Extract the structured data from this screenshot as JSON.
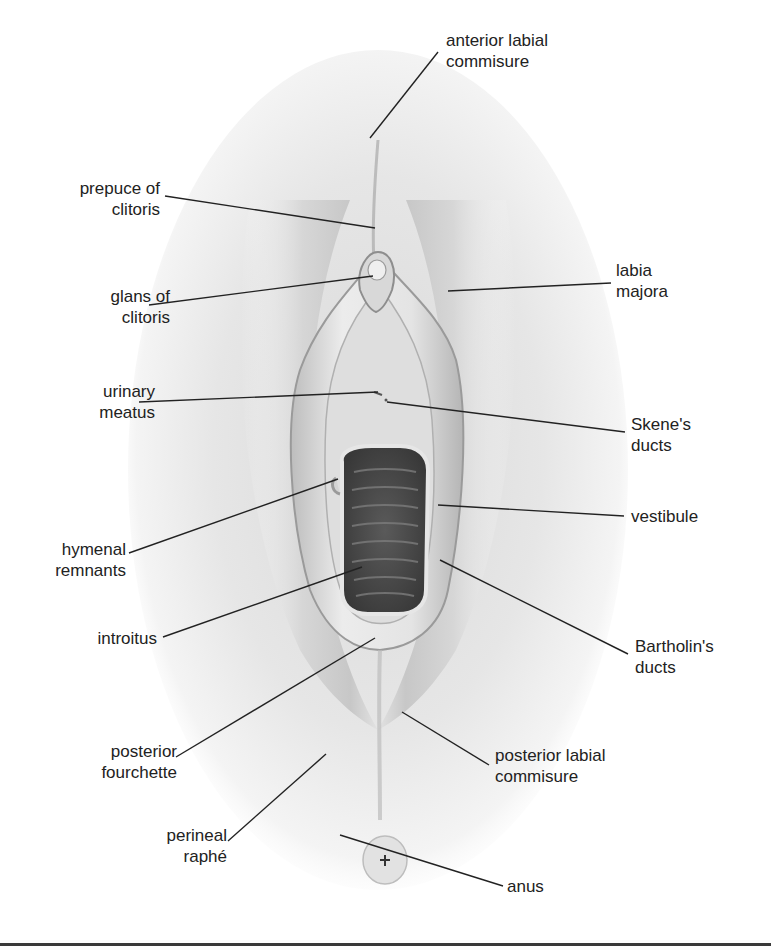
{
  "figure": {
    "colors": {
      "line": "#222222",
      "text": "#222222",
      "skin_light": "#f4f4f4",
      "skin_mid": "#cfcfcf",
      "skin_dark": "#8e8e8e",
      "introitus": "#4e4e4e"
    },
    "labels": [
      {
        "id": "anterior-labial-commisure",
        "lines": [
          "anterior labial",
          "commisure"
        ],
        "side": "right",
        "x": 446,
        "y": 30,
        "lx1": 438,
        "ly1": 52,
        "lx2": 370,
        "ly2": 138
      },
      {
        "id": "prepuce-of-clitoris",
        "lines": [
          "prepuce of",
          "clitoris"
        ],
        "side": "left",
        "x": 58,
        "y": 178,
        "w": 102,
        "lx1": 165,
        "ly1": 196,
        "lx2": 375,
        "ly2": 228
      },
      {
        "id": "glans-of-clitoris",
        "lines": [
          "glans of",
          "clitoris"
        ],
        "side": "left",
        "x": 60,
        "y": 286,
        "w": 110,
        "lx1": 149,
        "ly1": 305,
        "lx2": 373,
        "ly2": 276
      },
      {
        "id": "labia-majora",
        "lines": [
          "labia",
          "majora"
        ],
        "side": "right",
        "x": 616,
        "y": 260,
        "lx1": 611,
        "ly1": 283,
        "lx2": 448,
        "ly2": 291
      },
      {
        "id": "urinary-meatus",
        "lines": [
          "urinary",
          "meatus"
        ],
        "side": "left",
        "x": 60,
        "y": 381,
        "w": 95,
        "lx1": 139,
        "ly1": 402,
        "lx2": 378,
        "ly2": 392
      },
      {
        "id": "skenes-ducts",
        "lines": [
          "Skene's",
          "ducts"
        ],
        "side": "right",
        "x": 631,
        "y": 414,
        "lx1": 625,
        "ly1": 432,
        "lx2": 387,
        "ly2": 402
      },
      {
        "id": "vestibule",
        "lines": [
          "vestibule"
        ],
        "side": "right",
        "x": 631,
        "y": 506,
        "lx1": 624,
        "ly1": 516,
        "lx2": 438,
        "ly2": 505
      },
      {
        "id": "hymenal-remnants",
        "lines": [
          "hymenal",
          "remnants"
        ],
        "side": "left",
        "x": 40,
        "y": 539,
        "w": 86,
        "lx1": 129,
        "ly1": 553,
        "lx2": 338,
        "ly2": 479
      },
      {
        "id": "introitus",
        "lines": [
          "introitus"
        ],
        "side": "left",
        "x": 82,
        "y": 628,
        "w": 75,
        "lx1": 163,
        "ly1": 637,
        "lx2": 362,
        "ly2": 567
      },
      {
        "id": "bartholins-ducts",
        "lines": [
          "Bartholin's",
          "ducts"
        ],
        "side": "right",
        "x": 635,
        "y": 636,
        "lx1": 628,
        "ly1": 654,
        "lx2": 440,
        "ly2": 560
      },
      {
        "id": "posterior-fourchette",
        "lines": [
          "posterior",
          "fourchette"
        ],
        "side": "left",
        "x": 95,
        "y": 741,
        "w": 82,
        "lx1": 176,
        "ly1": 757,
        "lx2": 375,
        "ly2": 638
      },
      {
        "id": "posterior-labial-commisure",
        "lines": [
          "posterior labial",
          "commisure"
        ],
        "side": "right",
        "x": 495,
        "y": 745,
        "lx1": 489,
        "ly1": 765,
        "lx2": 402,
        "ly2": 712
      },
      {
        "id": "perineal-raphe",
        "lines": [
          "perineal",
          "raphé"
        ],
        "side": "left",
        "x": 143,
        "y": 825,
        "w": 84,
        "lx1": 228,
        "ly1": 841,
        "lx2": 326,
        "ly2": 754
      },
      {
        "id": "anus",
        "lines": [
          "anus"
        ],
        "side": "right",
        "x": 507,
        "y": 876,
        "lx1": 503,
        "ly1": 886,
        "lx2": 340,
        "ly2": 835
      }
    ]
  }
}
